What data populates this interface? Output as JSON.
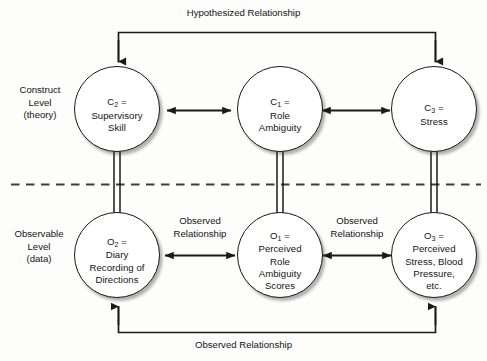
{
  "diagram": {
    "levels": [
      {
        "id": "construct",
        "label": "Construct\nLevel\n(theory)"
      },
      {
        "id": "observable",
        "label": "Observable\nLevel\n(data)"
      }
    ],
    "construct_nodes": [
      {
        "id": "c2",
        "symbol": "C",
        "subscript": "2",
        "equals": " =",
        "body": "Supervisory\nSkill"
      },
      {
        "id": "c1",
        "symbol": "C",
        "subscript": "1",
        "equals": " =",
        "body": "Role\nAmbiguity"
      },
      {
        "id": "c3",
        "symbol": "C",
        "subscript": "3",
        "equals": " =",
        "body": "Stress"
      }
    ],
    "observable_nodes": [
      {
        "id": "o2",
        "symbol": "O",
        "subscript": "2",
        "equals": " =",
        "body": "Diary\nRecording of\nDirections"
      },
      {
        "id": "o1",
        "symbol": "O",
        "subscript": "1",
        "equals": " =",
        "body": "Perceived\nRole\nAmbiguity\nScores"
      },
      {
        "id": "o3",
        "symbol": "O",
        "subscript": "3",
        "equals": " =",
        "body": "Perceived\nStress, Blood\nPressure,\netc."
      }
    ],
    "relationship_labels": {
      "top": "Hypothesized Relationship",
      "middle_left": "Observed\nRelationship",
      "middle_right": "Observed\nRelationship",
      "bottom": "Observed Relationship"
    },
    "colors": {
      "stroke": "#1a1a1a",
      "text": "#141414",
      "background": "#fdfdfc",
      "divider": "#3d3d3d"
    }
  }
}
